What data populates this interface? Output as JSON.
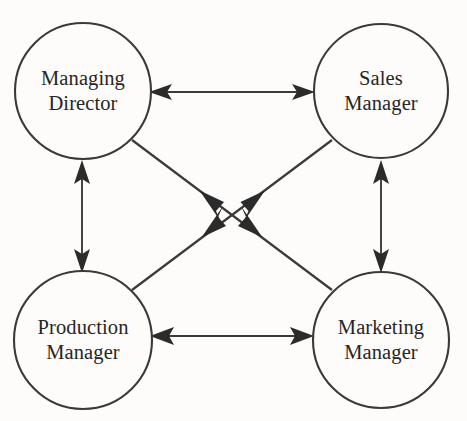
{
  "diagram": {
    "type": "node-link-diagram",
    "background_color": "#fdfcfa",
    "line_color": "#3a3a3a",
    "text_color": "#262626",
    "nodes": [
      {
        "id": "managing-director",
        "label_line1": "Managing",
        "label_line2": "Director",
        "cx": 83,
        "cy": 91,
        "r": 68
      },
      {
        "id": "sales-manager",
        "label_line1": "Sales",
        "label_line2": "Manager",
        "cx": 381,
        "cy": 91,
        "r": 67
      },
      {
        "id": "production-manager",
        "label_line1": "Production",
        "label_line2": "Manager",
        "cx": 83,
        "cy": 340,
        "r": 69
      },
      {
        "id": "marketing-manager",
        "label_line1": "Marketing",
        "label_line2": "Manager",
        "cx": 381,
        "cy": 340,
        "r": 68
      }
    ],
    "edges": [
      {
        "id": "md-sm",
        "from": "managing-director",
        "to": "sales-manager",
        "direction": "bidirectional",
        "style": "straight-horizontal"
      },
      {
        "id": "pm-mm",
        "from": "production-manager",
        "to": "marketing-manager",
        "direction": "bidirectional",
        "style": "straight-horizontal"
      },
      {
        "id": "md-pm",
        "from": "managing-director",
        "to": "production-manager",
        "direction": "bidirectional",
        "style": "straight-vertical"
      },
      {
        "id": "sm-mm",
        "from": "sales-manager",
        "to": "marketing-manager",
        "direction": "bidirectional",
        "style": "straight-vertical"
      },
      {
        "id": "md-mm",
        "from": "managing-director",
        "to": "marketing-manager",
        "direction": "bidirectional",
        "style": "diagonal-center-arrows"
      },
      {
        "id": "sm-pm",
        "from": "sales-manager",
        "to": "production-manager",
        "direction": "bidirectional",
        "style": "diagonal-center-arrows"
      }
    ]
  }
}
